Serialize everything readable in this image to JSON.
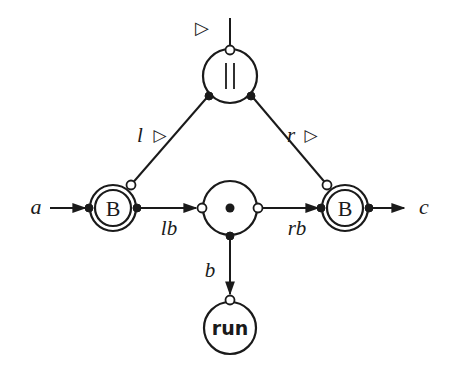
{
  "diagram": {
    "type": "process network / interaction net",
    "nodes": [
      {
        "id": "par",
        "label": "||",
        "shape": "circle"
      },
      {
        "id": "left_B",
        "label": "B",
        "shape": "double-circle"
      },
      {
        "id": "center",
        "label": "•",
        "shape": "circle"
      },
      {
        "id": "right_B",
        "label": "B",
        "shape": "double-circle"
      },
      {
        "id": "run",
        "label": "run",
        "shape": "circle"
      }
    ],
    "labels": {
      "input_a": "a",
      "output_c": "c",
      "top_marker": "▷",
      "left_link": "l",
      "left_marker": "▷",
      "right_link": "r",
      "right_marker": "▷",
      "lb": "lb",
      "rb": "rb",
      "b": "b"
    },
    "edges": [
      {
        "from": "a",
        "to": "left_B",
        "arrow": true
      },
      {
        "from": "top",
        "to": "par",
        "label": "▷"
      },
      {
        "from": "par",
        "to": "left_B",
        "label": "l ▷"
      },
      {
        "from": "par",
        "to": "right_B",
        "label": "r ▷"
      },
      {
        "from": "left_B",
        "to": "center",
        "label": "lb",
        "arrow": true
      },
      {
        "from": "center",
        "to": "right_B",
        "label": "rb",
        "arrow": true
      },
      {
        "from": "center",
        "to": "run",
        "label": "b",
        "arrow": true
      },
      {
        "from": "right_B",
        "to": "c",
        "arrow": true
      }
    ]
  }
}
